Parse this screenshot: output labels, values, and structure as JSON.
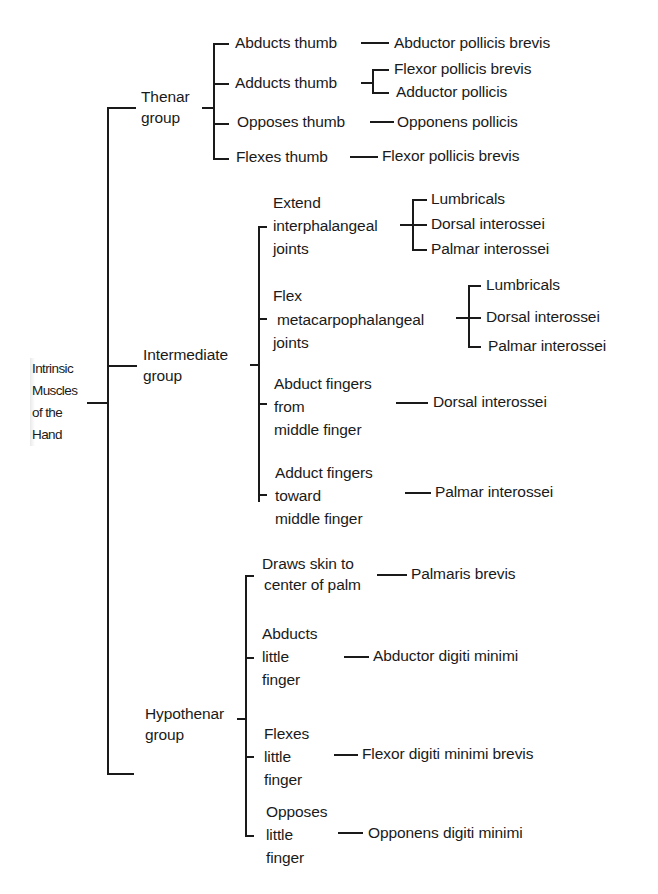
{
  "diagram": {
    "root": {
      "label_lines": [
        "Intrinsic",
        "Muscles",
        "of the",
        "Hand"
      ]
    },
    "groups": [
      {
        "label_lines": [
          "Thenar",
          "group"
        ],
        "actions": [
          {
            "label_lines": [
              "Abducts thumb"
            ],
            "muscles": [
              "Abductor pollicis brevis"
            ]
          },
          {
            "label_lines": [
              "Adducts thumb"
            ],
            "muscles": [
              "Flexor pollicis brevis",
              "Adductor pollicis"
            ]
          },
          {
            "label_lines": [
              "Opposes thumb"
            ],
            "muscles": [
              "Opponens pollicis"
            ]
          },
          {
            "label_lines": [
              "Flexes thumb"
            ],
            "muscles": [
              "Flexor pollicis brevis"
            ]
          }
        ]
      },
      {
        "label_lines": [
          "Intermediate",
          "group"
        ],
        "actions": [
          {
            "label_lines": [
              "Extend",
              "interphalangeal",
              "joints"
            ],
            "muscles": [
              "Lumbricals",
              "Dorsal interossei",
              "Palmar interossei"
            ]
          },
          {
            "label_lines": [
              "Flex",
              "metacarpophalangeal",
              "joints"
            ],
            "muscles": [
              "Lumbricals",
              "Dorsal interossei",
              "Palmar interossei"
            ]
          },
          {
            "label_lines": [
              "Abduct fingers",
              "from",
              "middle finger"
            ],
            "muscles": [
              "Dorsal interossei"
            ]
          },
          {
            "label_lines": [
              "Adduct fingers",
              "toward",
              "middle finger"
            ],
            "muscles": [
              "Palmar interossei"
            ]
          }
        ]
      },
      {
        "label_lines": [
          "Hypothenar",
          "group"
        ],
        "actions": [
          {
            "label_lines": [
              "Draws skin to",
              "center of palm"
            ],
            "muscles": [
              "Palmaris brevis"
            ]
          },
          {
            "label_lines": [
              "Abducts",
              "little",
              "finger"
            ],
            "muscles": [
              "Abductor digiti minimi"
            ]
          },
          {
            "label_lines": [
              "Flexes",
              "little",
              "finger"
            ],
            "muscles": [
              "Flexor digiti minimi brevis"
            ]
          },
          {
            "label_lines": [
              "Opposes",
              "little",
              "finger"
            ],
            "muscles": [
              "Opponens digiti minimi"
            ]
          }
        ]
      }
    ],
    "colors": {
      "ink": "#1a1a1a",
      "background": "#ffffff"
    }
  }
}
